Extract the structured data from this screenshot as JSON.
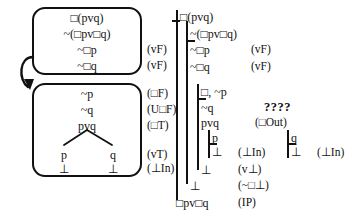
{
  "figure": {
    "symbols": {
      "box": "□",
      "or": "v",
      "neg": "~",
      "bottom": "⊥"
    }
  },
  "left_panel": {
    "name": "tableau-boxes",
    "box1": {
      "lines": [
        {
          "formula": "□(pvq)",
          "justification": ""
        },
        {
          "formula": "~(□pv□q)",
          "justification": ""
        },
        {
          "formula": "~□p",
          "justification": "(vF)"
        },
        {
          "formula": "~□q",
          "justification": "(vF)"
        }
      ]
    },
    "arrow": {
      "name": "transition-arrow",
      "label": ""
    },
    "box2": {
      "lines": [
        {
          "formula": "~p",
          "justification": "(□F)"
        },
        {
          "formula": "~q",
          "justification": "(U□F)"
        },
        {
          "formula": "pvq",
          "justification": "(□T)"
        }
      ],
      "branches": {
        "left": {
          "formula": "p",
          "bottom": "⊥"
        },
        "right": {
          "formula": "q",
          "bottom": "⊥"
        },
        "justification_branch": "(vT)",
        "justification_bottom": "(⊥In)"
      }
    }
  },
  "right_panel": {
    "name": "fitch-proof",
    "lines": [
      {
        "id": "l1",
        "formula": "□(pvq)",
        "justification": ""
      },
      {
        "id": "l2",
        "formula": "~(□pv□q)",
        "justification": ""
      },
      {
        "id": "l3",
        "formula": "~□p",
        "justification": "(vF)"
      },
      {
        "id": "l4",
        "formula": "~□q",
        "justification": "(vF)"
      },
      {
        "id": "l5",
        "formula": "□, ~p",
        "justification": ""
      },
      {
        "id": "l6",
        "formula": "~q",
        "justification": ""
      },
      {
        "id": "l7",
        "formula": "pvq",
        "justification": "(□Out)"
      },
      {
        "id": "l8",
        "formula": "p",
        "justification": ""
      },
      {
        "id": "l9",
        "formula": "⊥",
        "justification": "(⊥In)"
      },
      {
        "id": "l10",
        "formula": "q",
        "justification": ""
      },
      {
        "id": "l11",
        "formula": "⊥",
        "justification": "(⊥In)"
      },
      {
        "id": "l12",
        "formula": "⊥",
        "justification": "(v⊥)"
      },
      {
        "id": "l13",
        "formula": "⊥",
        "justification": "(~□⊥)"
      },
      {
        "id": "l14",
        "formula": "□pv□q",
        "justification": "(IP)"
      }
    ],
    "query_marker": "????"
  }
}
